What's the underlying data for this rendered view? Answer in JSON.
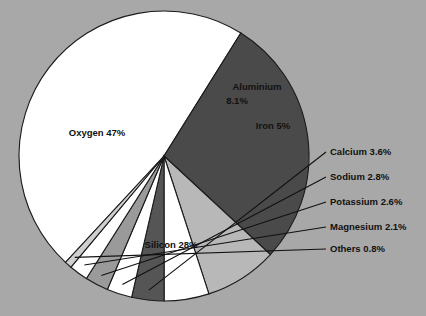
{
  "chart_data": {
    "type": "pie",
    "title": "",
    "subtitle": "",
    "xlabel": "",
    "ylabel": "",
    "legend_position": "none",
    "grid": false,
    "units": "percent",
    "total": 100.0,
    "start_angle_deg_clockwise_from_top": 32,
    "direction": "counterclockwise-from-start",
    "categories": [
      "Oxygen",
      "Silicon",
      "Aluminium",
      "Iron",
      "Calcium",
      "Sodium",
      "Potassium",
      "Magnesium",
      "Others"
    ],
    "values": [
      47,
      28,
      8.1,
      5,
      3.6,
      2.8,
      2.6,
      2.1,
      0.8
    ],
    "slices": [
      {
        "name": "Oxygen",
        "value": 47,
        "label": "Oxygen 47%",
        "value_label": "47%",
        "color": "#ffffff",
        "label_placement": "inside",
        "label_lines": [
          "Oxygen 47%"
        ]
      },
      {
        "name": "Silicon",
        "value": 28,
        "label": "Silicon 28%",
        "value_label": "28%",
        "color": "#4a4a4a",
        "label_placement": "inside",
        "label_lines": [
          "Silicon 28%"
        ]
      },
      {
        "name": "Aluminium",
        "value": 8.1,
        "label": "Aluminium 8.1%",
        "value_label": "8.1%",
        "color": "#b8b8b8",
        "label_placement": "inside",
        "label_lines": [
          "Aluminium",
          "8.1%"
        ]
      },
      {
        "name": "Iron",
        "value": 5,
        "label": "Iron 5%",
        "value_label": "5%",
        "color": "#ffffff",
        "label_placement": "inside",
        "label_lines": [
          "Iron 5%"
        ]
      },
      {
        "name": "Calcium",
        "value": 3.6,
        "label": "Calcium 3.6%",
        "value_label": "3.6%",
        "color": "#555555",
        "label_placement": "outside-leader",
        "label_lines": [
          "Calcium 3.6%"
        ]
      },
      {
        "name": "Sodium",
        "value": 2.8,
        "label": "Sodium 2.8%",
        "value_label": "2.8%",
        "color": "#ffffff",
        "label_placement": "outside-leader",
        "label_lines": [
          "Sodium 2.8%"
        ]
      },
      {
        "name": "Potassium",
        "value": 2.6,
        "label": "Potassium 2.6%",
        "value_label": "2.6%",
        "color": "#9a9a9a",
        "label_placement": "outside-leader",
        "label_lines": [
          "Potassium 2.6%"
        ]
      },
      {
        "name": "Magnesium",
        "value": 2.1,
        "label": "Magnesium 2.1%",
        "value_label": "2.1%",
        "color": "#ffffff",
        "label_placement": "outside-leader",
        "label_lines": [
          "Magnesium 2.1%"
        ]
      },
      {
        "name": "Others",
        "value": 0.8,
        "label": "Others 0.8%",
        "value_label": "0.8%",
        "color": "#cfcfcf",
        "label_placement": "outside-leader",
        "label_lines": [
          "Others 0.8%"
        ]
      }
    ],
    "colors": {
      "background": "#a8a8a8",
      "outline": "#1a1a1a",
      "text": "#111111",
      "white_slice": "#ffffff",
      "light_gray_slice": "#b8b8b8",
      "mid_gray_slice": "#9a9a9a",
      "dark_gray_slice": "#4a4a4a"
    },
    "geometry": {
      "center_x": 164,
      "center_y": 156,
      "radius": 145
    }
  },
  "labels": {
    "oxygen": "Oxygen 47%",
    "silicon": "Silicon 28%",
    "aluminium_line1": "Aluminium",
    "aluminium_line2": "8.1%",
    "iron": "Iron 5%",
    "calcium": "Calcium 3.6%",
    "sodium": "Sodium 2.8%",
    "potassium": "Potassium 2.6%",
    "magnesium": "Magnesium 2.1%",
    "others": "Others 0.8%"
  }
}
